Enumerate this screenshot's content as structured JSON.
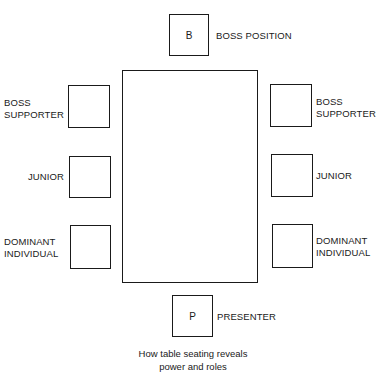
{
  "diagram": {
    "table": {
      "label": ""
    },
    "seats": {
      "boss": {
        "letter": "B",
        "label": "BOSS POSITION"
      },
      "left_boss_supporter": {
        "label_line1": "BOSS",
        "label_line2": "SUPPORTER"
      },
      "left_junior": {
        "label": "JUNIOR"
      },
      "left_dominant": {
        "label_line1": "DOMINANT",
        "label_line2": "INDIVIDUAL"
      },
      "right_boss_supporter": {
        "label_line1": "BOSS",
        "label_line2": "SUPPORTER"
      },
      "right_junior": {
        "label": "JUNIOR"
      },
      "right_dominant": {
        "label_line1": "DOMINANT",
        "label_line2": "INDIVIDUAL"
      },
      "presenter": {
        "letter": "P",
        "label": "PRESENTER"
      }
    },
    "caption": {
      "line1": "How table seating reveals",
      "line2": "power and roles"
    }
  }
}
